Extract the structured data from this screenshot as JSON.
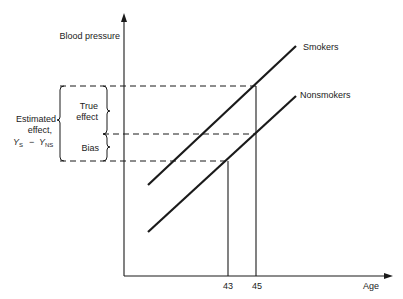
{
  "diagram": {
    "y_axis_label": "Blood pressure",
    "x_axis_label": "Age",
    "x_ticks": [
      "43",
      "45"
    ],
    "series": [
      {
        "name": "Smokers"
      },
      {
        "name": "Nonsmokers"
      }
    ],
    "annotations": {
      "true_effect_line1": "True",
      "true_effect_line2": "effect",
      "bias": "Bias",
      "estimated_line1": "Estimated",
      "estimated_line2": "effect,",
      "estimated_formula_ys": "Y",
      "estimated_formula_ys_sub": "S",
      "estimated_formula_minus": "−",
      "estimated_formula_yns": "Y",
      "estimated_formula_yns_sub": "NS"
    }
  }
}
